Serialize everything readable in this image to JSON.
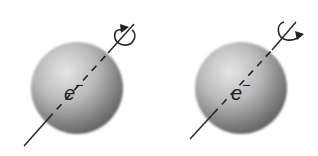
{
  "diagram": {
    "title": "",
    "electrons": [
      {
        "id": "left",
        "label": "e",
        "charge": "−",
        "spin": "clockwise-arrow (arrowhead left, pointing top)",
        "center": [
          77,
          88
        ],
        "radius": 47,
        "axis": {
          "from": [
            24,
            146
          ],
          "to": [
            134,
            24
          ]
        }
      },
      {
        "id": "right",
        "label": "e",
        "charge": "−",
        "spin": "counterclockwise-arrow (arrowhead right, pointing down)",
        "center": [
          241,
          88
        ],
        "radius": 47,
        "axis": {
          "from": [
            190,
            139
          ],
          "to": [
            296,
            22
          ]
        }
      }
    ],
    "colors": {
      "sphere_light": "#d9d9d9",
      "sphere_dark": "#5c5c5c",
      "line": "#222222"
    }
  }
}
